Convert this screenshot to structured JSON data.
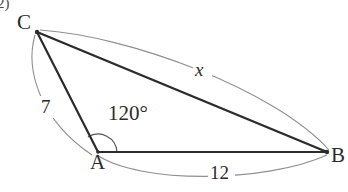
{
  "figure": {
    "type": "triangle-diagram",
    "problem_number": "2)",
    "background_color": "#ffffff",
    "stroke_color": "#2b2b2b",
    "arc_color": "#8a8a8a",
    "vertices": [
      {
        "name": "C",
        "label": "C",
        "x": 37,
        "y": 32
      },
      {
        "name": "A",
        "label": "A",
        "x": 98,
        "y": 152
      },
      {
        "name": "B",
        "label": "B",
        "x": 327,
        "y": 152
      }
    ],
    "sides": [
      {
        "name": "side-CA",
        "from": "C",
        "to": "A",
        "measure_label": "7"
      },
      {
        "name": "side-AB",
        "from": "A",
        "to": "B",
        "measure_label": "12"
      },
      {
        "name": "side-CB",
        "from": "C",
        "to": "B",
        "measure_label": "x"
      }
    ],
    "angles": [
      {
        "name": "angle-A",
        "at": "A",
        "label": "120°",
        "value": 120
      }
    ]
  }
}
